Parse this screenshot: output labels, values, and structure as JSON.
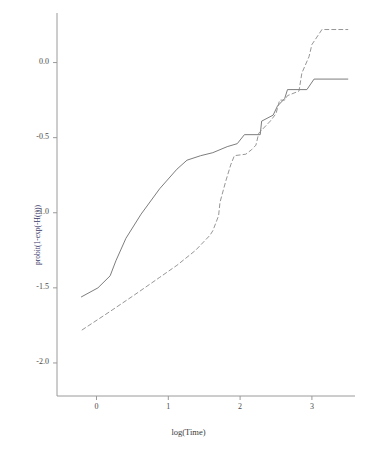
{
  "chart_data": {
    "type": "line",
    "title": "",
    "subtitle": "",
    "xlabel": "log(Time)",
    "ylabel": "probit(1-exp(-H(t)))",
    "xlim": [
      -0.55,
      3.6
    ],
    "ylim": [
      -2.22,
      0.33
    ],
    "xticks": [
      0,
      1,
      2,
      3
    ],
    "xtick_labels": [
      "0",
      "1",
      "2",
      "3"
    ],
    "yticks": [
      0.0,
      -0.5,
      -1.0,
      -1.5,
      -2.0
    ],
    "ytick_labels": [
      "0.0",
      "-0.5",
      "-1.0",
      "-1.5",
      "-2.0"
    ],
    "grid": false,
    "legend": "none",
    "axis_color": "#9a9a9a",
    "series": [
      {
        "name": "group-1-solid",
        "style": "solid",
        "color": "#6e6e6e",
        "points": [
          [
            -0.21,
            -1.56
          ],
          [
            0.02,
            -1.5
          ],
          [
            0.19,
            -1.42
          ],
          [
            0.27,
            -1.32
          ],
          [
            0.41,
            -1.17
          ],
          [
            0.62,
            -1.01
          ],
          [
            0.88,
            -0.84
          ],
          [
            1.12,
            -0.71
          ],
          [
            1.26,
            -0.65
          ],
          [
            1.45,
            -0.62
          ],
          [
            1.62,
            -0.6
          ],
          [
            1.82,
            -0.56
          ],
          [
            1.96,
            -0.54
          ],
          [
            2.06,
            -0.48
          ],
          [
            2.28,
            -0.48
          ],
          [
            2.3,
            -0.39
          ],
          [
            2.46,
            -0.35
          ],
          [
            2.52,
            -0.29
          ],
          [
            2.62,
            -0.24
          ],
          [
            2.66,
            -0.18
          ],
          [
            2.93,
            -0.18
          ],
          [
            3.03,
            -0.11
          ],
          [
            3.5,
            -0.11
          ]
        ]
      },
      {
        "name": "group-2-dashed",
        "style": "dashed",
        "color": "#8a8a8a",
        "points": [
          [
            -0.2,
            -1.78
          ],
          [
            0.18,
            -1.66
          ],
          [
            0.52,
            -1.55
          ],
          [
            0.88,
            -1.43
          ],
          [
            1.12,
            -1.35
          ],
          [
            1.38,
            -1.25
          ],
          [
            1.58,
            -1.15
          ],
          [
            1.62,
            -1.12
          ],
          [
            1.7,
            -1.02
          ],
          [
            1.72,
            -0.93
          ],
          [
            1.8,
            -0.79
          ],
          [
            1.87,
            -0.68
          ],
          [
            1.92,
            -0.62
          ],
          [
            2.08,
            -0.61
          ],
          [
            2.16,
            -0.58
          ],
          [
            2.22,
            -0.55
          ],
          [
            2.26,
            -0.47
          ],
          [
            2.42,
            -0.39
          ],
          [
            2.5,
            -0.34
          ],
          [
            2.55,
            -0.25
          ],
          [
            2.62,
            -0.25
          ],
          [
            2.66,
            -0.22
          ],
          [
            2.82,
            -0.19
          ],
          [
            2.86,
            -0.07
          ],
          [
            2.96,
            0.04
          ],
          [
            3.0,
            0.12
          ],
          [
            3.14,
            0.22
          ],
          [
            3.5,
            0.22
          ]
        ]
      }
    ]
  },
  "axes": {
    "x_label": "log(Time)",
    "y_label": "probit(1-exp(-H(t)))"
  }
}
